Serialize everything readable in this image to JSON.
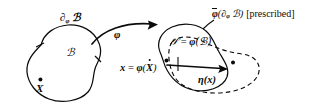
{
  "figure": {
    "domain": "continuum-mechanics-configuration-diagram",
    "background_color": "#ffffff",
    "ink_color": "#0b0b0b",
    "width": 330,
    "height": 112
  },
  "labels": {
    "reference_boundary": {
      "symbol": "∂",
      "subscript": "φ",
      "body": "ℬ"
    },
    "reference_body": "ℬ",
    "material_point": "X",
    "deformation_map": "φ",
    "current_config_lhs": "𝒮",
    "current_config_eq": "=",
    "current_config_rhs_fn": "φ",
    "current_config_rhs_arg": "(ℬ)",
    "spatial_point_lhs": "x",
    "spatial_point_eq": "=",
    "spatial_point_fn": "φ",
    "spatial_point_arg_open": "(",
    "spatial_point_arg": "X",
    "spatial_point_arg_close": ")",
    "variation_field": "η",
    "variation_field_arg": "(x)",
    "prescribed_fn": "φ",
    "prescribed_arg": "(∂",
    "prescribed_arg_sub": "φ",
    "prescribed_arg_body": "ℬ)",
    "prescribed_note": "[prescribed]"
  },
  "geometry": {
    "reference_blob_stroke": "solid",
    "current_blob_stroke": "solid",
    "perturbed_blob_stroke": "dashed",
    "boundary_tick_count": 2,
    "arrow_map_label": "φ",
    "arrow_variation_label": "η(x)"
  }
}
